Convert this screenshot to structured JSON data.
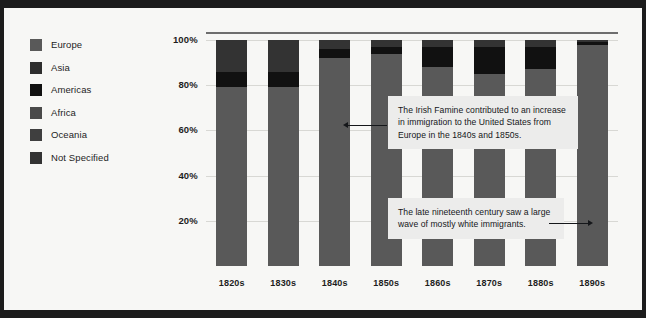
{
  "theme": {
    "page_background": "#f7f7f5",
    "frame_color": "#1c1c1c",
    "text_color": "#1d1d1d",
    "gridline_color": "#d8d8d4",
    "axis_color": "#6e6e6e",
    "annotation_background": "#ececeb"
  },
  "legend": {
    "items": [
      {
        "label": "Europe",
        "color": "#595959"
      },
      {
        "label": "Asia",
        "color": "#2e2e2e"
      },
      {
        "label": "Americas",
        "color": "#111111"
      },
      {
        "label": "Africa",
        "color": "#4a4a4a"
      },
      {
        "label": "Oceania",
        "color": "#3f3f3f"
      },
      {
        "label": "Not Specified",
        "color": "#333333"
      }
    ]
  },
  "chart_data": {
    "type": "bar",
    "stacked": true,
    "normalized": true,
    "title": "",
    "xlabel": "",
    "ylabel": "",
    "ylim": [
      0,
      100
    ],
    "grid": true,
    "legend_position": "left",
    "categories": [
      "1820s",
      "1830s",
      "1840s",
      "1850s",
      "1860s",
      "1870s",
      "1880s",
      "1890s"
    ],
    "ytick_labels": [
      "20%",
      "40%",
      "60%",
      "80%",
      "100%"
    ],
    "ytick_values": [
      20,
      40,
      60,
      80,
      100
    ],
    "series": [
      {
        "name": "Europe",
        "color": "#595959",
        "values": [
          79,
          79,
          92,
          94,
          88,
          85,
          87,
          98
        ]
      },
      {
        "name": "Americas",
        "color": "#111111",
        "values": [
          7,
          7,
          4,
          3,
          9,
          12,
          10,
          1
        ]
      },
      {
        "name": "Not Specified",
        "color": "#333333",
        "values": [
          14,
          14,
          4,
          3,
          3,
          3,
          3,
          1
        ]
      },
      {
        "name": "Asia",
        "color": "#2e2e2e",
        "values": [
          0,
          0,
          0,
          0,
          0,
          0,
          0,
          0
        ]
      },
      {
        "name": "Africa",
        "color": "#4a4a4a",
        "values": [
          0,
          0,
          0,
          0,
          0,
          0,
          0,
          0
        ]
      },
      {
        "name": "Oceania",
        "color": "#3f3f3f",
        "values": [
          0,
          0,
          0,
          0,
          0,
          0,
          0,
          0
        ]
      }
    ]
  },
  "annotations": [
    {
      "id": "irish-famine",
      "text": "The Irish Famine contributed to an increase in immigration to the United States from Europe in the 1840s and 1850s.",
      "arrow_direction": "left"
    },
    {
      "id": "late-nineteenth-century",
      "text": "The late nineteenth century saw a large wave of mostly white immigrants.",
      "arrow_direction": "right"
    }
  ]
}
